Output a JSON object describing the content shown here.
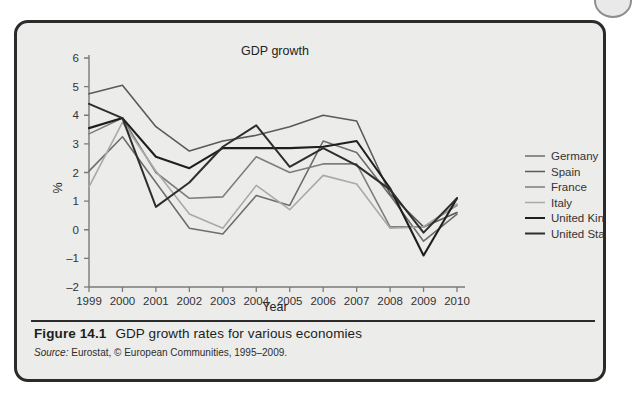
{
  "figure": {
    "caption_label": "Figure 14.1",
    "caption_text": "GDP growth rates for various economies",
    "source_word": "Source:",
    "source_text": "Eurostat, © European Communities, 1995–2009."
  },
  "chart_data": {
    "type": "line",
    "title": "GDP growth",
    "xlabel": "Year",
    "ylabel": "%",
    "x": [
      1999,
      2000,
      2001,
      2002,
      2003,
      2004,
      2005,
      2006,
      2007,
      2008,
      2009,
      2010
    ],
    "xtick_labels": [
      "1999",
      "2000",
      "2001",
      "2002",
      "2003",
      "2004",
      "2005",
      "2006",
      "2007",
      "2008",
      "2009",
      "2010"
    ],
    "ytick_labels": [
      "6",
      "5",
      "4",
      "3",
      "2",
      "1",
      "0",
      "-1",
      "-2"
    ],
    "ylim": [
      -2,
      6
    ],
    "xlim": [
      1999,
      2010
    ],
    "ytick_step": 1,
    "grid": false,
    "legend_position": "right",
    "series": [
      {
        "name": "Germany",
        "color": "#6e6e6e",
        "width": 1.6,
        "values": [
          2.05,
          3.25,
          1.65,
          0.05,
          -0.15,
          1.2,
          0.85,
          3.1,
          2.7,
          1.2,
          -0.4,
          0.55
        ]
      },
      {
        "name": "Spain",
        "color": "#5a5a5a",
        "width": 1.6,
        "values": [
          4.75,
          5.05,
          3.6,
          2.75,
          3.1,
          3.3,
          3.6,
          4.0,
          3.8,
          1.25,
          0.1,
          0.6
        ]
      },
      {
        "name": "France",
        "color": "#7d7d7d",
        "width": 1.6,
        "values": [
          3.35,
          3.9,
          2.0,
          1.1,
          1.15,
          2.55,
          2.0,
          2.3,
          2.3,
          0.1,
          0.1,
          0.85
        ]
      },
      {
        "name": "Italy",
        "color": "#a9a9a9",
        "width": 1.6,
        "values": [
          1.5,
          3.75,
          2.05,
          0.55,
          0.05,
          1.55,
          0.7,
          1.9,
          1.6,
          0.05,
          0.1,
          0.9
        ]
      },
      {
        "name": "United Kingdom",
        "color": "#1f1f1f",
        "width": 2.1,
        "values": [
          3.55,
          3.9,
          2.55,
          2.15,
          2.85,
          2.85,
          2.85,
          2.9,
          3.1,
          1.45,
          -0.9,
          1.1
        ]
      },
      {
        "name": "United States",
        "color": "#2e2e2e",
        "width": 2.0,
        "values": [
          4.4,
          3.9,
          0.8,
          1.65,
          2.9,
          3.65,
          2.2,
          2.85,
          2.25,
          1.4,
          -0.1,
          1.1
        ]
      }
    ]
  }
}
